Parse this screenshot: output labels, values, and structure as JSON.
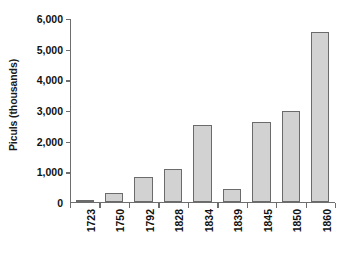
{
  "chart_data": {
    "type": "bar",
    "title": "",
    "subtitle": "",
    "xlabel": "",
    "ylabel": "Piculs (thousands)",
    "categories": [
      "1723",
      "1750",
      "1792",
      "1828",
      "1834",
      "1839",
      "1845",
      "1850",
      "1860"
    ],
    "values": [
      70,
      300,
      840,
      1090,
      2530,
      450,
      2620,
      2970,
      5550
    ],
    "series": [
      {
        "name": "Piculs",
        "values": [
          70,
          300,
          840,
          1090,
          2530,
          450,
          2620,
          2970,
          5550
        ]
      }
    ],
    "ylim": [
      0,
      6000
    ],
    "ytick_labels": [
      "0",
      "1,000",
      "2,000",
      "3,000",
      "4,000",
      "5,000",
      "6,000"
    ],
    "ytick_values": [
      0,
      1000,
      2000,
      3000,
      4000,
      5000,
      6000
    ],
    "grid": false,
    "legend": false,
    "legend_position": "none",
    "bar_fill_color": "#d2d2d2",
    "bar_border_color": "#6b6b6b",
    "axis_color": "#6e6e6e",
    "background_color": "#ffffff",
    "text_color": "#111111",
    "xtick_label_rotation": 90,
    "ylabel_rotation": 90
  }
}
